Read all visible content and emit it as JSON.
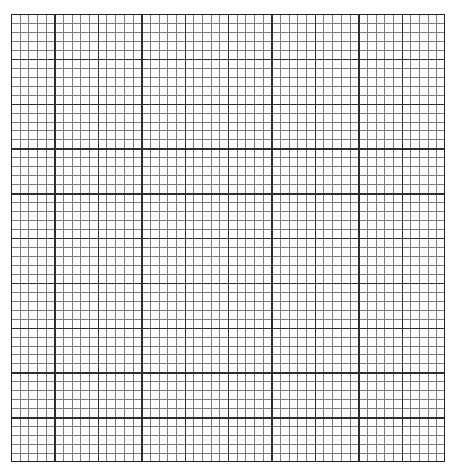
{
  "document": {
    "type": "graph-paper",
    "title": "Graph paper grid",
    "description": "Blank square-ruled graph paper sheet"
  },
  "canvas": {
    "width_px": 459,
    "height_px": 474,
    "background_color": "#ffffff"
  },
  "grid": {
    "left_px": 11,
    "top_px": 14,
    "width_px": 434,
    "height_px": 448,
    "minor_cells_x": 50,
    "minor_cells_y": 50,
    "minor_cell_width_px": 8.68,
    "minor_cell_height_px": 8.96,
    "major_blocks_x": 10,
    "major_blocks_y": 10,
    "minor_per_major": 5,
    "major_block_width_px": 43.4,
    "major_block_height_px": 44.8,
    "minor_line_color": "#7b7b7b",
    "major_line_color": "#2e2e2e",
    "border_color": "#222222",
    "minor_line_width_px": 1,
    "major_line_width_px": 1.4,
    "border_width_px": 1.6,
    "paper_color": "#fdfdfd"
  },
  "labels": {
    "axis_x": "",
    "axis_y": "",
    "tick_labels_x": [],
    "tick_labels_y": [],
    "annotations": []
  }
}
